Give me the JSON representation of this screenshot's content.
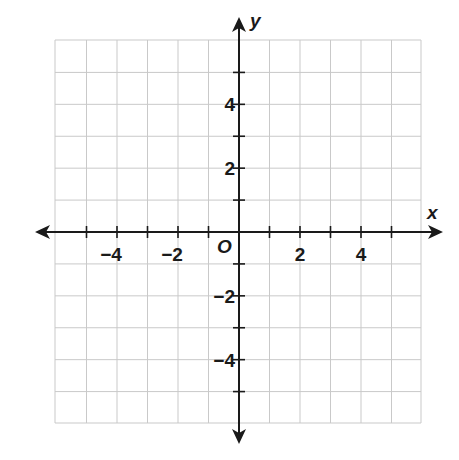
{
  "diagram": {
    "type": "coordinate-plane",
    "x_axis_label": "x",
    "y_axis_label": "y",
    "origin_label": "O",
    "x_range": [
      -6,
      6
    ],
    "y_range": [
      -6,
      6
    ],
    "grid_step": 1,
    "x_tick_labels": [
      {
        "value": -4,
        "text": "−4"
      },
      {
        "value": -2,
        "text": "−2"
      },
      {
        "value": 2,
        "text": "2"
      },
      {
        "value": 4,
        "text": "4"
      }
    ],
    "y_tick_labels": [
      {
        "value": 4,
        "text": "4"
      },
      {
        "value": 2,
        "text": "2"
      },
      {
        "value": -2,
        "text": "−2"
      },
      {
        "value": -4,
        "text": "−4"
      }
    ],
    "colors": {
      "grid": "#c9c9c9",
      "axis": "#1a1a1a",
      "background": "#ffffff"
    }
  }
}
